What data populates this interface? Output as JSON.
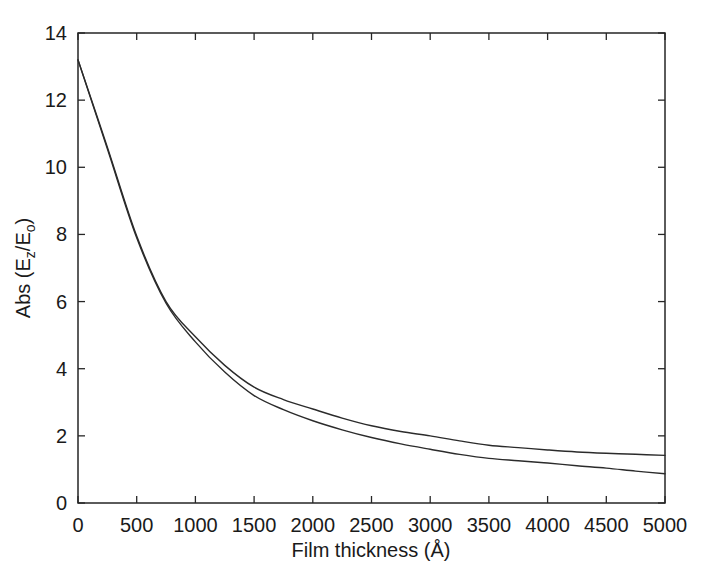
{
  "figure": {
    "background": "#ffffff",
    "axis_color": "#262626",
    "curve_color": "#2b2b2b",
    "text_color": "#1a1a1a"
  },
  "chart_data": {
    "type": "line",
    "title": "",
    "xlabel": "Film thickness (Å)",
    "ylabel": "Abs (Ez/Eo)",
    "ylabel_parts": {
      "prefix": "Abs (E",
      "sub1": "z",
      "mid": "/E",
      "sub2": "o",
      "suffix": ")"
    },
    "xlim": [
      0,
      5000
    ],
    "ylim": [
      0,
      14
    ],
    "x_ticks": [
      0,
      500,
      1000,
      1500,
      2000,
      2500,
      3000,
      3500,
      4000,
      4500,
      5000
    ],
    "y_ticks": [
      0,
      2,
      4,
      6,
      8,
      10,
      12,
      14
    ],
    "grid": false,
    "legend": "none",
    "tick_style": "inward-all-sides",
    "x": [
      0,
      250,
      500,
      750,
      1000,
      1250,
      1500,
      1750,
      2000,
      2250,
      2500,
      2750,
      3000,
      3250,
      3500,
      3750,
      4000,
      4250,
      4500,
      4750,
      5000
    ],
    "series": [
      {
        "name": "upper curve",
        "values": [
          13.2,
          10.6,
          7.95,
          6.0,
          4.95,
          4.1,
          3.45,
          3.08,
          2.8,
          2.53,
          2.3,
          2.13,
          2.0,
          1.85,
          1.72,
          1.65,
          1.58,
          1.52,
          1.48,
          1.45,
          1.42
        ]
      },
      {
        "name": "lower curve",
        "values": [
          13.2,
          10.55,
          7.9,
          5.95,
          4.8,
          3.9,
          3.2,
          2.78,
          2.45,
          2.18,
          1.95,
          1.76,
          1.6,
          1.45,
          1.33,
          1.26,
          1.19,
          1.11,
          1.04,
          0.95,
          0.87
        ]
      }
    ]
  }
}
